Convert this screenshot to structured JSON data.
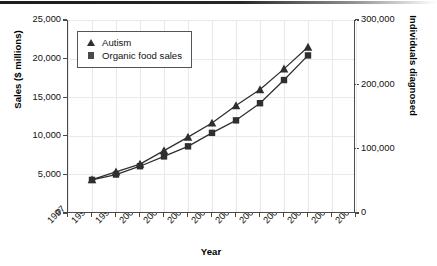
{
  "chart_data": {
    "type": "line",
    "title": "",
    "subtitle": "",
    "xlabel": "Year",
    "ylabel": "Sales ($ millions)",
    "y2label": "Individuals diagnosed",
    "grid": true,
    "legend_position": "top-left",
    "x_tick_labels": [
      "1997",
      "1998",
      "1999",
      "2000",
      "2001",
      "2002",
      "2003",
      "2004",
      "2005",
      "2006",
      "2007",
      "2008",
      "2009"
    ],
    "xlim": [
      1997,
      2009
    ],
    "ylim": [
      0,
      25000
    ],
    "y2lim": [
      0,
      300000
    ],
    "y_tick_labels": [
      "25,000",
      "20,000",
      "15,000",
      "10,000",
      "5,000",
      "0"
    ],
    "y_tick_values": [
      25000,
      20000,
      15000,
      10000,
      5000,
      0
    ],
    "y2_tick_labels": [
      "300,000",
      "200,000",
      "100,000",
      "0"
    ],
    "y2_tick_values": [
      300000,
      200000,
      100000,
      0
    ],
    "x": [
      1998,
      1999,
      2000,
      2001,
      2002,
      2003,
      2004,
      2005,
      2006,
      2007
    ],
    "series": [
      {
        "name": "Autism",
        "marker": "triangle",
        "axis": "right",
        "units": "individuals diagnosed",
        "values": [
          52000,
          64000,
          76000,
          97000,
          118000,
          140000,
          167000,
          192000,
          224000,
          258000
        ]
      },
      {
        "name": "Organic food sales",
        "marker": "square",
        "axis": "left",
        "units": "$ millions",
        "values": [
          4286,
          4981,
          6061,
          7329,
          8635,
          10381,
          12000,
          14223,
          17221,
          20410
        ]
      }
    ]
  },
  "legend": {
    "items": [
      {
        "label": "Autism",
        "marker": "triangle"
      },
      {
        "label": "Organic food sales",
        "marker": "square"
      }
    ]
  },
  "colors": {
    "series_dark": "#2f2f2f",
    "axis": "#4a4a4a",
    "grid": "#e9e9ec",
    "text": "#111111",
    "background": "#ffffff"
  }
}
